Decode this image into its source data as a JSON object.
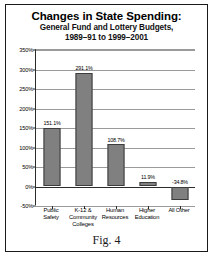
{
  "figure": {
    "caption": "Fig. 4"
  },
  "chart_data": {
    "type": "bar",
    "title": "Changes in State Spending:",
    "subtitle_line1": "General Fund and Lottery Budgets,",
    "subtitle_line2": "1989–91 to 1999–2001",
    "xlabel": "",
    "ylabel": "",
    "ylim": [
      -50,
      350
    ],
    "grid": true,
    "legend": null,
    "ytick_labels": [
      "350%",
      "300%",
      "250%",
      "200%",
      "150%",
      "100%",
      "50%",
      "0%",
      "-50%"
    ],
    "ytick_values": [
      350,
      300,
      250,
      200,
      150,
      100,
      50,
      0,
      -50
    ],
    "categories": [
      "Public\nSafety",
      "K-12 &\nCommunity\nColleges",
      "Human\nResources",
      "Higher\nEducation",
      "All Other"
    ],
    "category_lines": [
      [
        "Public",
        "Safety"
      ],
      [
        "K-12 &",
        "Community",
        "Colleges"
      ],
      [
        "Human",
        "Resources"
      ],
      [
        "Higher",
        "Education"
      ],
      [
        "All Other"
      ]
    ],
    "values": [
      151.1,
      291.1,
      108.7,
      11.9,
      -34.8
    ],
    "value_labels": [
      "151.1%",
      "291.1%",
      "108.7%",
      "11.9%",
      "-34.8%"
    ],
    "bar_color": "#808080",
    "bar_edge_color": "#3c3c3c",
    "gridline_color": "#9a9a9a",
    "axis_color": "#2b2b2b"
  }
}
